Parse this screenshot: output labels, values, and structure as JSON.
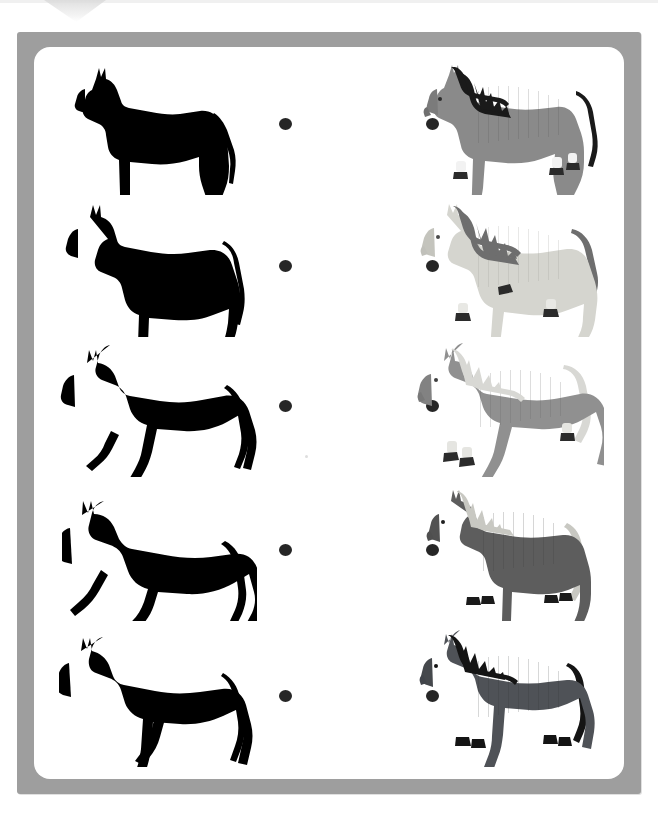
{
  "worksheet": {
    "title": "Match the horse silhouettes",
    "frame_color": "#9e9e9e",
    "page_background": "#ffffff",
    "card_background": "#ffffff",
    "dot_color": "#262626",
    "rows": [
      {
        "index": 1,
        "left": {
          "label": "horse-silhouette-standing",
          "pose": "standing",
          "fill": "#000000"
        },
        "right": {
          "label": "horse-gray-black-mane-walking",
          "pose": "standing",
          "body": "#8a8a8a",
          "body_shade": "#7b7b7b",
          "mane": "#1a1a1a",
          "tail": "#1a1a1a",
          "sock": "#f2f2f2",
          "hoof": "#2b2b2b"
        },
        "left_dot": "connector-dot",
        "right_dot": "connector-dot"
      },
      {
        "index": 2,
        "left": {
          "label": "horse-silhouette-trotting",
          "pose": "trotting",
          "fill": "#000000"
        },
        "right": {
          "label": "horse-white-gray-mane-trotting",
          "pose": "trotting",
          "body": "#d5d5cf",
          "body_shade": "#c4c4bd",
          "mane": "#6e6e6e",
          "tail": "#6e6e6e",
          "sock": "#e8e8e4",
          "hoof": "#2b2b2b"
        },
        "left_dot": "connector-dot",
        "right_dot": "connector-dot"
      },
      {
        "index": 3,
        "left": {
          "label": "horse-silhouette-cantering",
          "pose": "cantering",
          "fill": "#000000"
        },
        "right": {
          "label": "horse-gray-light-mane-cantering",
          "pose": "cantering",
          "body": "#909090",
          "body_shade": "#828282",
          "mane": "#d8d8d4",
          "tail": "#d8d8d4",
          "sock": "#e5e5e1",
          "hoof": "#2b2b2b"
        },
        "left_dot": "connector-dot",
        "right_dot": "connector-dot"
      },
      {
        "index": 4,
        "left": {
          "label": "horse-silhouette-jumping",
          "pose": "jumping",
          "fill": "#000000"
        },
        "right": {
          "label": "horse-darkgray-light-mane-standing",
          "pose": "standing",
          "body": "#5d5d5d",
          "body_shade": "#525252",
          "mane": "#c8c8c2",
          "tail": "#c8c8c2",
          "sock": "#5d5d5d",
          "hoof": "#1a1a1a"
        },
        "left_dot": "connector-dot",
        "right_dot": "connector-dot"
      },
      {
        "index": 5,
        "left": {
          "label": "horse-silhouette-walking",
          "pose": "walking",
          "fill": "#000000"
        },
        "right": {
          "label": "horse-slate-black-mane-walking",
          "pose": "walking",
          "body": "#4f5257",
          "body_shade": "#45484c",
          "mane": "#141414",
          "tail": "#141414",
          "sock": "#4f5257",
          "hoof": "#141414"
        },
        "left_dot": "connector-dot",
        "right_dot": "connector-dot"
      }
    ]
  }
}
